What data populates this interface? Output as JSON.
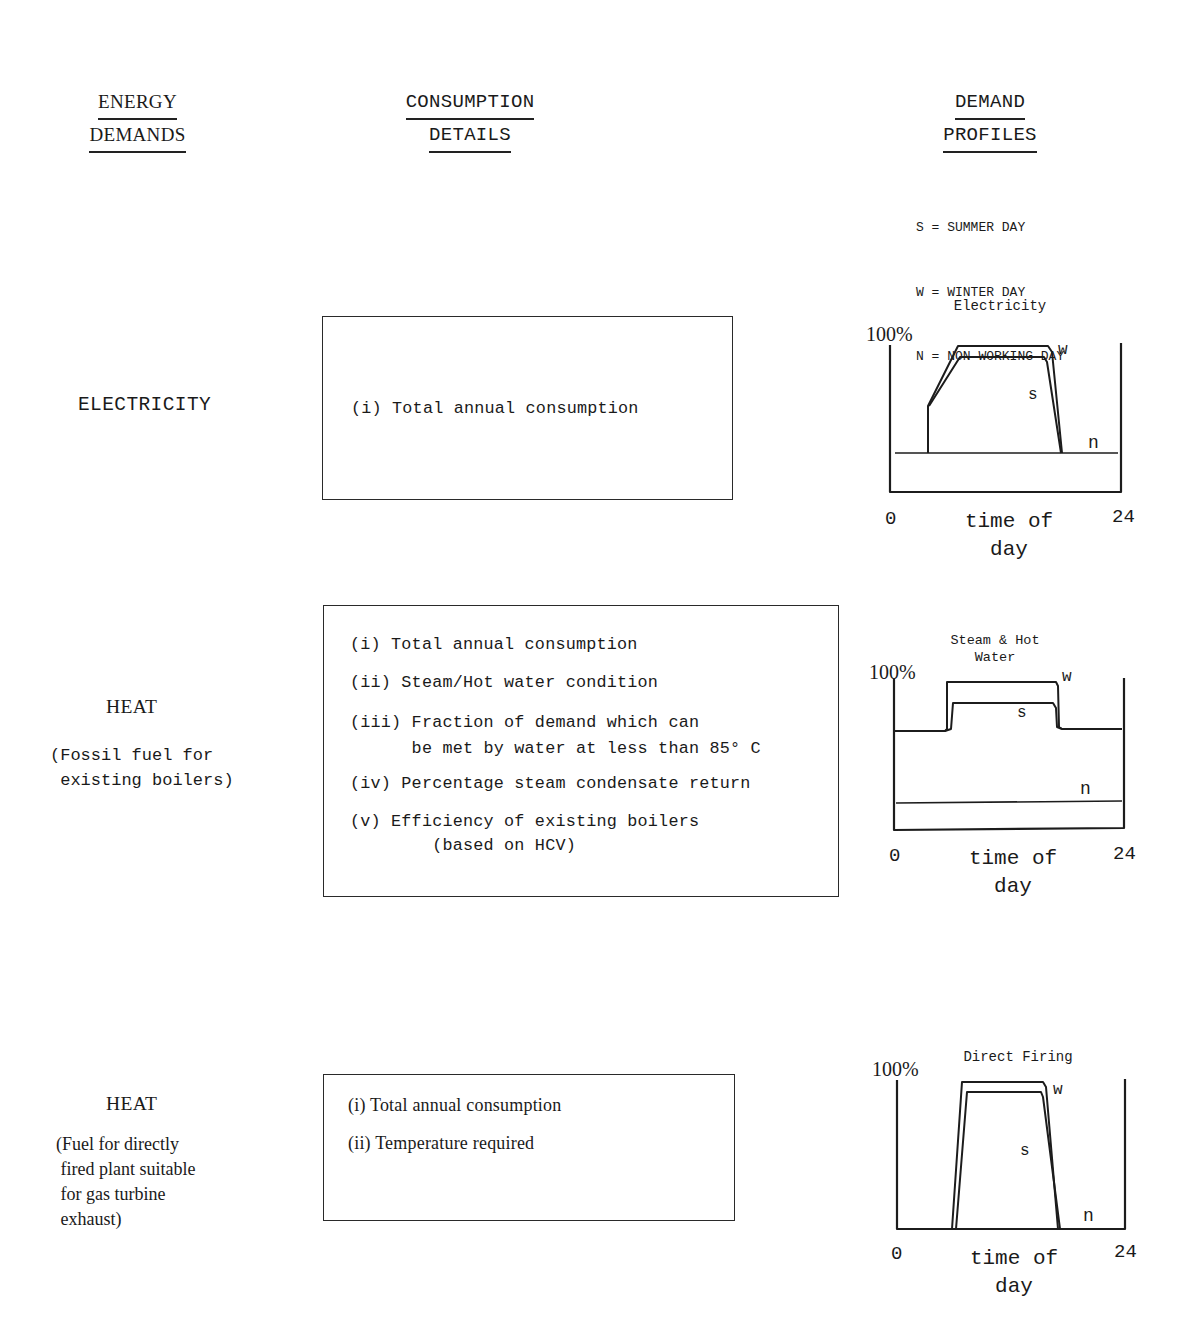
{
  "headers": {
    "energy_demands": [
      "ENERGY",
      "DEMANDS"
    ],
    "consumption_details": [
      "CONSUMPTION",
      "DETAILS"
    ],
    "demand_profiles": [
      "DEMAND",
      "PROFILES"
    ]
  },
  "legend": [
    {
      "key": "S",
      "label": "S = SUMMER DAY"
    },
    {
      "key": "W",
      "label": "W = WINTER DAY"
    },
    {
      "key": "N",
      "label": "N = NON WORKING DAY"
    }
  ],
  "rows": [
    {
      "category": "ELECTRICITY",
      "subtitle": "",
      "details": [
        "(i) Total annual consumption"
      ]
    },
    {
      "category": "HEAT",
      "subtitle": "(Fossil fuel for\n existing boilers)",
      "details": [
        "(i) Total annual consumption",
        "(ii) Steam/Hot water condition",
        "(iii) Fraction of demand which can\n      be met by water at less than 85° C",
        "(iv) Percentage steam condensate return",
        "(v) Efficiency of existing boilers\n        (based on HCV)"
      ]
    },
    {
      "category": "HEAT",
      "subtitle": "(Fuel for directly\n fired plant suitable\n for gas turbine\n exhaust)",
      "details": [
        "(i) Total annual consumption",
        "(ii) Temperature required"
      ]
    }
  ],
  "chart_common": {
    "y_max_label": "100%",
    "x_min_label": "0",
    "x_max_label": "24",
    "x_label_line1": "time of",
    "x_label_line2": "day",
    "curve_labels": {
      "w": "w",
      "s": "s",
      "n": "n"
    }
  },
  "chart_data": [
    {
      "type": "line",
      "title": "Electricity",
      "xlabel": "time of day",
      "ylabel": "",
      "xlim": [
        0,
        24
      ],
      "ylim": [
        0,
        100
      ],
      "y_tick_labels": [
        "100%"
      ],
      "x_tick_labels": [
        "0",
        "24"
      ],
      "series": [
        {
          "name": "w (winter day)",
          "x": [
            0,
            4,
            4,
            7,
            16.5,
            17.5,
            24
          ],
          "y": [
            27,
            27,
            57,
            98,
            98,
            27,
            27
          ]
        },
        {
          "name": "s (summer day)",
          "x": [
            0,
            4,
            4,
            7,
            16,
            17.5,
            24
          ],
          "y": [
            27,
            27,
            57,
            91,
            91,
            27,
            27
          ]
        },
        {
          "name": "n (non working day)",
          "x": [
            0,
            24
          ],
          "y": [
            27,
            27
          ]
        }
      ]
    },
    {
      "type": "line",
      "title": "Steam & Hot Water",
      "xlabel": "time of day",
      "ylabel": "",
      "xlim": [
        0,
        24
      ],
      "ylim": [
        0,
        100
      ],
      "y_tick_labels": [
        "100%"
      ],
      "x_tick_labels": [
        "0",
        "24"
      ],
      "series": [
        {
          "name": "w (winter day)",
          "x": [
            0,
            5.5,
            5.5,
            17,
            17,
            24
          ],
          "y": [
            64,
            64,
            97,
            97,
            66,
            66
          ]
        },
        {
          "name": "s (summer day)",
          "x": [
            0,
            6,
            6,
            16.5,
            17,
            24
          ],
          "y": [
            64,
            64,
            83,
            83,
            66,
            66
          ]
        },
        {
          "name": "n (non working day)",
          "x": [
            0,
            24
          ],
          "y": [
            16,
            17
          ]
        }
      ]
    },
    {
      "type": "line",
      "title": "Direct Firing",
      "xlabel": "time of day",
      "ylabel": "",
      "xlim": [
        0,
        24
      ],
      "ylim": [
        0,
        100
      ],
      "y_tick_labels": [
        "100%"
      ],
      "x_tick_labels": [
        "0",
        "24"
      ],
      "series": [
        {
          "name": "w (winter day)",
          "x": [
            0,
            6,
            7,
            15.5,
            17,
            24
          ],
          "y": [
            0,
            0,
            98,
            98,
            0,
            0
          ]
        },
        {
          "name": "s (summer day)",
          "x": [
            0,
            6.3,
            7.5,
            15.3,
            17.2,
            24
          ],
          "y": [
            0,
            0,
            92,
            92,
            0,
            0
          ]
        },
        {
          "name": "n (non working day)",
          "x": [
            0,
            24
          ],
          "y": [
            0,
            0
          ]
        }
      ]
    }
  ]
}
